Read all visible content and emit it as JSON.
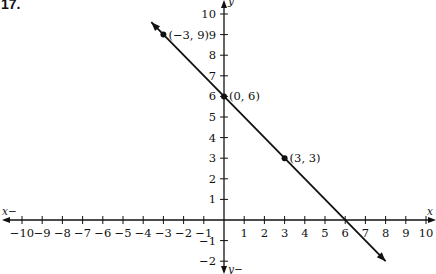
{
  "problem_number": "17.",
  "chart_data": {
    "type": "line",
    "title": "",
    "xlabel": "x",
    "ylabel": "y",
    "xlim": [
      -10,
      10
    ],
    "ylim": [
      -2,
      10
    ],
    "grid": false,
    "x_ticks": [
      -10,
      -9,
      -8,
      -7,
      -6,
      -5,
      -4,
      -3,
      -2,
      -1,
      1,
      2,
      3,
      4,
      5,
      6,
      7,
      8,
      9,
      10
    ],
    "y_ticks": [
      -2,
      -1,
      1,
      2,
      3,
      4,
      5,
      6,
      7,
      8,
      9,
      10
    ],
    "x_tick_labels": [
      "−10",
      "−9",
      "−8",
      "−7",
      "−6",
      "−5",
      "−4",
      "−3",
      "−2",
      "−1",
      "1",
      "2",
      "3",
      "4",
      "5",
      "6",
      "7",
      "8",
      "9",
      "10"
    ],
    "y_tick_labels": [
      "−2",
      "−1",
      "1",
      "2",
      "3",
      "4",
      "5",
      "6",
      "7",
      "8",
      "9",
      "10"
    ],
    "axis_labels": {
      "x_neg": "x−",
      "x_pos": "x",
      "y_pos": "y",
      "y_neg": "y−"
    },
    "line": {
      "equation": "y = -x + 6",
      "slope": -1,
      "intercept": 6,
      "x_start": -3.6,
      "x_end": 8,
      "arrows": "both"
    },
    "series": [
      {
        "name": "points",
        "points": [
          {
            "x": -3,
            "y": 9,
            "label": "(−3, 9)"
          },
          {
            "x": 0,
            "y": 6,
            "label": "(0, 6)"
          },
          {
            "x": 3,
            "y": 3,
            "label": "(3, 3)"
          }
        ]
      }
    ],
    "colors": {
      "ink": "#111111",
      "background": "#ffffff"
    }
  }
}
